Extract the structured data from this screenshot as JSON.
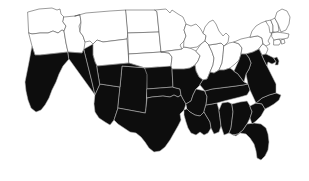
{
  "figure": {
    "type": "choropleth-map",
    "region": "Contiguous United States",
    "title": "",
    "legend": "",
    "background_color": "#ffffff"
  },
  "chart_data": {
    "type": "map",
    "title": "",
    "xlabel": "",
    "ylabel": "",
    "legend_position": "none",
    "grid": false,
    "projection": "albers-usa-approximate",
    "categories": [
      "highlighted",
      "not-highlighted"
    ],
    "colors": {
      "highlighted_fill": "#0d0d0d",
      "highlighted_border": "#b9b9b9",
      "not_highlighted_fill": "#ffffff",
      "not_highlighted_border": "#4a4a4a",
      "background": "#ffffff"
    },
    "counts": {
      "highlighted": 24,
      "not_highlighted": 24,
      "total": 48
    },
    "highlighted_states": [
      "California",
      "Nevada",
      "Utah",
      "Arizona",
      "New Mexico",
      "Colorado",
      "Kansas",
      "Oklahoma",
      "Texas",
      "Missouri",
      "Arkansas",
      "Louisiana",
      "Mississippi",
      "Alabama",
      "Georgia",
      "Florida",
      "South Carolina",
      "North Carolina",
      "Tennessee",
      "Kentucky",
      "Virginia",
      "West Virginia",
      "Maryland",
      "Delaware"
    ],
    "not_highlighted_states": [
      "Washington",
      "Oregon",
      "Idaho",
      "Montana",
      "Wyoming",
      "North Dakota",
      "South Dakota",
      "Nebraska",
      "Minnesota",
      "Iowa",
      "Wisconsin",
      "Illinois",
      "Indiana",
      "Michigan",
      "Ohio",
      "Pennsylvania",
      "New York",
      "New Jersey",
      "Connecticut",
      "Rhode Island",
      "Massachusetts",
      "Vermont",
      "New Hampshire",
      "Maine"
    ],
    "states": [
      {
        "code": "WA",
        "name": "Washington",
        "value": 0
      },
      {
        "code": "OR",
        "name": "Oregon",
        "value": 0
      },
      {
        "code": "ID",
        "name": "Idaho",
        "value": 0
      },
      {
        "code": "MT",
        "name": "Montana",
        "value": 0
      },
      {
        "code": "WY",
        "name": "Wyoming",
        "value": 0
      },
      {
        "code": "ND",
        "name": "North Dakota",
        "value": 0
      },
      {
        "code": "SD",
        "name": "South Dakota",
        "value": 0
      },
      {
        "code": "NE",
        "name": "Nebraska",
        "value": 0
      },
      {
        "code": "MN",
        "name": "Minnesota",
        "value": 0
      },
      {
        "code": "IA",
        "name": "Iowa",
        "value": 0
      },
      {
        "code": "WI",
        "name": "Wisconsin",
        "value": 0
      },
      {
        "code": "IL",
        "name": "Illinois",
        "value": 0
      },
      {
        "code": "IN",
        "name": "Indiana",
        "value": 0
      },
      {
        "code": "MI",
        "name": "Michigan",
        "value": 0
      },
      {
        "code": "OH",
        "name": "Ohio",
        "value": 0
      },
      {
        "code": "PA",
        "name": "Pennsylvania",
        "value": 0
      },
      {
        "code": "NY",
        "name": "New York",
        "value": 0
      },
      {
        "code": "NJ",
        "name": "New Jersey",
        "value": 0
      },
      {
        "code": "CT",
        "name": "Connecticut",
        "value": 0
      },
      {
        "code": "RI",
        "name": "Rhode Island",
        "value": 0
      },
      {
        "code": "MA",
        "name": "Massachusetts",
        "value": 0
      },
      {
        "code": "VT",
        "name": "Vermont",
        "value": 0
      },
      {
        "code": "NH",
        "name": "New Hampshire",
        "value": 0
      },
      {
        "code": "ME",
        "name": "Maine",
        "value": 0
      },
      {
        "code": "CA",
        "name": "California",
        "value": 1
      },
      {
        "code": "NV",
        "name": "Nevada",
        "value": 1
      },
      {
        "code": "UT",
        "name": "Utah",
        "value": 1
      },
      {
        "code": "AZ",
        "name": "Arizona",
        "value": 1
      },
      {
        "code": "NM",
        "name": "New Mexico",
        "value": 1
      },
      {
        "code": "CO",
        "name": "Colorado",
        "value": 1
      },
      {
        "code": "KS",
        "name": "Kansas",
        "value": 1
      },
      {
        "code": "OK",
        "name": "Oklahoma",
        "value": 1
      },
      {
        "code": "TX",
        "name": "Texas",
        "value": 1
      },
      {
        "code": "MO",
        "name": "Missouri",
        "value": 1
      },
      {
        "code": "AR",
        "name": "Arkansas",
        "value": 1
      },
      {
        "code": "LA",
        "name": "Louisiana",
        "value": 1
      },
      {
        "code": "MS",
        "name": "Mississippi",
        "value": 1
      },
      {
        "code": "AL",
        "name": "Alabama",
        "value": 1
      },
      {
        "code": "GA",
        "name": "Georgia",
        "value": 1
      },
      {
        "code": "FL",
        "name": "Florida",
        "value": 1
      },
      {
        "code": "SC",
        "name": "South Carolina",
        "value": 1
      },
      {
        "code": "NC",
        "name": "North Carolina",
        "value": 1
      },
      {
        "code": "TN",
        "name": "Tennessee",
        "value": 1
      },
      {
        "code": "KY",
        "name": "Kentucky",
        "value": 1
      },
      {
        "code": "VA",
        "name": "Virginia",
        "value": 1
      },
      {
        "code": "WV",
        "name": "West Virginia",
        "value": 1
      },
      {
        "code": "MD",
        "name": "Maryland",
        "value": 1
      },
      {
        "code": "DE",
        "name": "Delaware",
        "value": 1
      }
    ]
  },
  "geometry": {
    "WA": "M28,12 L39,9 L52,8 L57,10 L60,9 L61,14 L64,17 L63,22 L66,26 L64,31 L62,30 L58,33 L53,31 L48,33 L40,33 L32,34 L29,33 Z",
    "OR": "M29,33 L32,34 L40,33 L48,33 L53,31 L58,33 L62,30 L64,31 L66,43 L68,52 L40,55 L35,55 L32,46 Z",
    "ID": "M64,17 L75,16 L80,15 L81,22 L79,26 L80,32 L83,36 L85,42 L84,49 L82,53 L68,52 L66,43 L64,31 L66,26 L63,22 Z",
    "MT": "M75,16 L86,13 L110,11 L126,10 L128,33 L127,39 L103,42 L97,40 L93,44 L90,41 L85,42 L83,36 L80,32 L81,22 L80,15 Z",
    "WY": "M93,44 L97,40 L103,42 L127,39 L129,63 L97,66 L95,62 L93,55 Z",
    "ND": "M126,10 L155,10 L157,12 L159,32 L128,33 Z",
    "SD": "M128,33 L159,32 L161,52 L129,54 Z",
    "NE": "M129,54 L161,52 L169,53 L172,57 L171,66 L165,69 L158,67 L145,68 L129,63 Z",
    "MN": "M155,10 L166,9 L170,13 L172,10 L178,14 L183,17 L186,24 L184,30 L186,36 L184,41 L180,45 L182,49 L161,52 L159,32 L157,12 Z",
    "IA": "M182,49 L184,47 L190,48 L196,51 L200,56 L198,61 L195,65 L190,68 L184,69 L172,69 L171,66 L172,57 L169,53 L161,52 Z",
    "WI": "M184,41 L186,36 L184,30 L186,24 L191,26 L196,24 L200,28 L203,33 L206,36 L205,41 L201,44 L197,47 L190,48 L184,47 Z",
    "IL": "M196,51 L201,44 L205,41 L209,45 L212,52 L214,58 L213,65 L210,72 L207,79 L203,80 L199,77 L196,71 L195,65 L198,61 L200,56 Z",
    "IN": "M209,45 L216,44 L221,43 L224,46 L223,55 L222,63 L219,70 L214,73 L210,72 L213,65 L214,58 L212,52 Z",
    "MI": "M203,33 L205,27 L209,22 L213,20 L216,24 L219,31 L223,36 L226,33 L229,36 L228,42 L224,46 L221,43 L216,44 L209,45 L205,41 L206,36 Z",
    "OH": "M224,46 L229,43 L234,42 L239,44 L242,48 L241,54 L239,60 L235,64 L230,68 L224,70 L219,70 L222,63 L223,55 Z",
    "PA": "M234,42 L241,39 L250,37 L258,36 L262,38 L263,44 L259,49 L253,52 L246,54 L241,54 L242,48 L239,44 Z",
    "NY": "M250,37 L252,31 L256,26 L261,23 L266,21 L270,24 L274,26 L276,30 L272,33 L270,37 L268,41 L270,44 L266,46 L263,44 L262,38 L258,36 Z",
    "NJ": "M263,44 L266,46 L268,49 L266,54 L262,55 L260,51 L259,49 Z",
    "CT": "M274,40 L279,39 L281,42 L279,45 L274,45 Z",
    "RI": "M281,40 L284,39 L285,43 L282,44 Z",
    "MA": "M272,33 L276,32 L284,33 L289,34 L288,38 L283,39 L279,39 L274,40 L272,37 Z",
    "VT": "M266,21 L271,20 L273,26 L273,32 L270,33 L269,27 Z",
    "NH": "M271,20 L275,18 L278,24 L279,31 L276,32 L273,32 L273,26 Z",
    "ME": "M275,18 L277,12 L282,9 L287,11 L290,17 L289,24 L286,30 L281,32 L278,24 Z",
    "CA": "M32,46 L35,55 L40,55 L68,52 L69,59 L63,66 L59,74 L56,82 L52,90 L49,98 L45,105 L41,110 L36,112 L31,108 L28,100 L26,91 L25,82 L27,72 L29,62 Z",
    "NV": "M68,52 L82,53 L84,49 L88,66 L92,82 L95,95 L69,59 Z",
    "UT": "M84,49 L93,44 L93,55 L95,62 L97,66 L100,84 L95,95 L92,82 L88,66 Z",
    "AZ": "M95,95 L100,84 L120,87 L118,108 L114,120 L110,125 L105,122 L99,118 L95,112 L94,104 Z",
    "NM": "M120,87 L122,66 L148,68 L147,91 L146,108 L145,113 L118,108 Z",
    "CO": "M97,66 L129,63 L145,68 L148,68 L122,66 L120,87 L100,84 Z",
    "KS": "M145,68 L171,66 L172,69 L173,87 L147,89 L147,75 Z",
    "OK": "M147,89 L173,87 L176,88 L180,89 L181,95 L178,97 L174,95 L170,97 L163,96 L152,97 L147,98 Z",
    "TX": "M146,108 L147,98 L152,97 L163,96 L170,97 L174,95 L178,97 L181,95 L183,99 L186,104 L184,110 L180,114 L181,120 L178,126 L174,133 L170,140 L165,147 L160,151 L154,152 L149,148 L145,142 L141,137 L136,133 L130,132 L124,128 L118,124 L114,120 L118,108 L145,113 Z",
    "MO": "M173,87 L172,69 L184,69 L190,68 L195,65 L196,71 L199,77 L203,80 L200,85 L196,89 L193,95 L191,101 L186,104 L183,99 L181,95 L180,89 L176,88 Z",
    "AR": "M186,104 L191,101 L193,95 L196,89 L205,91 L207,97 L206,105 L204,112 L200,116 L195,115 L190,112 L187,109 Z",
    "LA": "M187,109 L190,112 L195,115 L200,116 L204,112 L207,117 L210,122 L211,128 L208,133 L204,135 L200,132 L196,135 L191,133 L188,128 L186,122 L184,115 L184,110 Z",
    "MS": "M206,105 L212,104 L217,103 L219,110 L220,118 L221,126 L219,132 L214,134 L211,128 L210,122 L207,117 L204,112 Z",
    "AL": "M219,110 L222,103 L228,102 L232,104 L233,112 L232,120 L231,128 L229,133 L224,135 L221,126 L220,118 Z",
    "GA": "M232,104 L240,102 L247,101 L250,106 L252,112 L250,118 L247,124 L243,130 L238,134 L233,135 L229,133 L231,128 L232,120 L233,112 Z",
    "FL": "M243,130 L247,124 L254,123 L261,124 L266,128 L268,134 L269,142 L268,150 L265,156 L261,160 L257,158 L256,151 L254,144 L250,138 L246,134 L240,133 L236,136 L233,135 L238,134 Z",
    "SC": "M250,106 L256,103 L262,104 L265,109 L261,116 L256,121 L252,124 L250,118 L252,112 Z",
    "NC": "M256,103 L262,98 L269,95 L276,93 L281,95 L279,100 L274,104 L269,107 L265,109 L262,104 Z",
    "TN": "M205,91 L212,89 L220,88 L228,87 L236,86 L243,85 L248,84 L250,90 L247,95 L240,97 L232,99 L224,101 L217,103 L212,104 L206,105 L207,97 Z",
    "KY": "M203,80 L207,79 L210,72 L214,73 L219,70 L224,70 L230,68 L234,71 L238,74 L241,78 L244,82 L248,84 L243,85 L236,86 L228,87 L220,88 L212,89 L205,91 L200,85 Z",
    "WV": "M234,71 L239,60 L241,54 L246,54 L249,58 L251,63 L249,69 L246,74 L244,82 L241,78 L238,74 Z",
    "VA": "M246,54 L253,52 L259,49 L260,51 L262,55 L264,60 L267,66 L270,72 L273,78 L276,84 L276,93 L269,95 L262,98 L256,103 L250,90 L248,84 L246,74 L249,69 L251,63 L249,58 Z",
    "MD": "M262,55 L266,54 L270,56 L274,58 L276,62 L272,64 L268,62 L267,66 L264,60 Z",
    "DE": "M274,58 L277,57 L279,61 L278,65 L275,65 L276,62 Z"
  }
}
